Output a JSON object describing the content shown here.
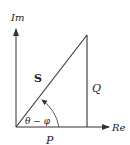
{
  "diagram": {
    "axes": {
      "imaginary_label": "Im",
      "real_label": "Re"
    },
    "sides": {
      "hypotenuse_label": "S",
      "vertical_label": "Q",
      "horizontal_label": "P"
    },
    "angle_label": "θ − φ",
    "colors": {
      "line": "#333333",
      "text": "#222222",
      "background": "#ffffff"
    }
  }
}
